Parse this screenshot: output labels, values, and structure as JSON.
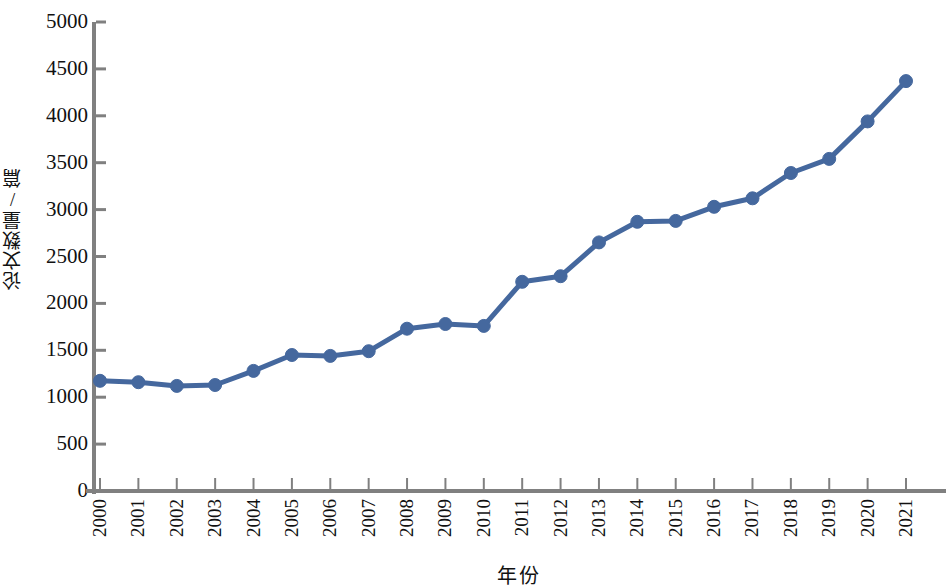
{
  "chart_data": {
    "type": "line",
    "title": "",
    "xlabel": "年份",
    "ylabel": "论文数量/篇",
    "grid": false,
    "legend": "none",
    "line_color": "#45689E",
    "marker_color": "#45689E",
    "axis_color": "#808080",
    "marker": "circle",
    "xlim": [
      2000,
      2021
    ],
    "ylim": [
      0,
      5000
    ],
    "ytick_labels": [
      "0",
      "500",
      "1000",
      "1500",
      "2000",
      "2500",
      "3000",
      "3500",
      "4000",
      "4500",
      "5000"
    ],
    "ytick_values": [
      0,
      500,
      1000,
      1500,
      2000,
      2500,
      3000,
      3500,
      4000,
      4500,
      5000
    ],
    "categories": [
      "2000",
      "2001",
      "2002",
      "2003",
      "2004",
      "2005",
      "2006",
      "2007",
      "2008",
      "2009",
      "2010",
      "2011",
      "2012",
      "2013",
      "2014",
      "2015",
      "2016",
      "2017",
      "2018",
      "2019",
      "2020",
      "2021"
    ],
    "x": [
      2000,
      2001,
      2002,
      2003,
      2004,
      2005,
      2006,
      2007,
      2008,
      2009,
      2010,
      2011,
      2012,
      2013,
      2014,
      2015,
      2016,
      2017,
      2018,
      2019,
      2020,
      2021
    ],
    "values": [
      1175,
      1160,
      1120,
      1130,
      1280,
      1450,
      1440,
      1490,
      1730,
      1780,
      1760,
      2230,
      2290,
      2650,
      2870,
      2880,
      3030,
      3120,
      3390,
      3540,
      3940,
      4370
    ]
  }
}
